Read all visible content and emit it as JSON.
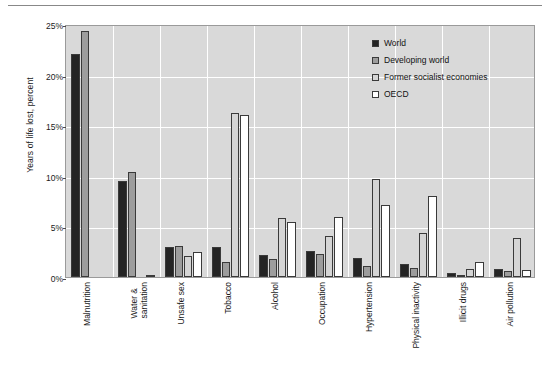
{
  "chart_data": {
    "type": "bar",
    "title": "",
    "subtitle": "",
    "xlabel": "",
    "ylabel": "Years of life lost, percent",
    "ylim": [
      0,
      25
    ],
    "ytick_labels": [
      "0%",
      "5%",
      "10%",
      "15%",
      "20%",
      "25%"
    ],
    "ytick_values": [
      0,
      5,
      10,
      15,
      20,
      25
    ],
    "grid": true,
    "grid_orientation": "both",
    "legend_position": "top-right",
    "units": "percent",
    "categories": [
      "Malnutrition",
      "Water &\nsanitation",
      "Unsafe sex",
      "Tobacco",
      "Alcohol",
      "Occupation",
      "Hypertension",
      "Physical inactivity",
      "Illicit drugs",
      "Air pollution"
    ],
    "series": [
      {
        "name": "World",
        "color": "#242424",
        "values": [
          22.0,
          9.5,
          3.0,
          3.0,
          2.2,
          2.6,
          1.9,
          1.3,
          0.4,
          0.8
        ]
      },
      {
        "name": "Developing world",
        "color": "#9d9d9d",
        "values": [
          24.3,
          10.4,
          3.1,
          1.5,
          1.8,
          2.3,
          1.1,
          0.9,
          0.2,
          0.6
        ]
      },
      {
        "name": "Former socialist economies",
        "color": "#d5d5d5",
        "values": [
          0.0,
          0.0,
          2.1,
          16.2,
          5.8,
          4.1,
          9.7,
          4.3,
          0.8,
          3.9
        ]
      },
      {
        "name": "OECD",
        "color": "#ffffff",
        "values": [
          0.0,
          0.2,
          2.5,
          16.0,
          5.4,
          5.9,
          7.1,
          8.0,
          1.5,
          0.7
        ]
      }
    ]
  },
  "legend": {
    "items": [
      {
        "label": "World"
      },
      {
        "label": "Developing world"
      },
      {
        "label": "Former socialist economies"
      },
      {
        "label": "OECD"
      }
    ]
  }
}
